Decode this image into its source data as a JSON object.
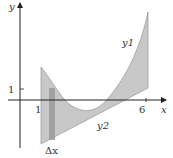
{
  "diagram": {
    "axes": {
      "x_label": "x",
      "y_label": "y"
    },
    "ticks": {
      "x_one": "1",
      "x_six": "6",
      "y_one": "1"
    },
    "curves": {
      "upper": "y1",
      "upper_sub": "1",
      "lower": "y2",
      "lower_sub": "2"
    },
    "strip_label": "Δx",
    "colors": {
      "region": "#c8c8c8",
      "strip": "#9a9a9a",
      "axis": "#222222"
    }
  }
}
